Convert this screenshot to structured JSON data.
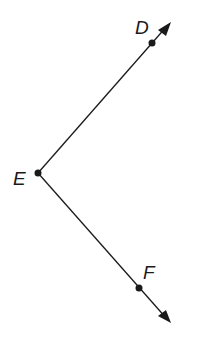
{
  "diagram": {
    "type": "angle",
    "vertex": {
      "label": "E",
      "x": 38,
      "y": 173
    },
    "rays": [
      {
        "from": "E",
        "through": "D",
        "point": {
          "label": "D",
          "x": 152,
          "y": 43
        },
        "tip": {
          "x": 171,
          "y": 22
        }
      },
      {
        "from": "E",
        "through": "F",
        "point": {
          "label": "F",
          "x": 139,
          "y": 288
        },
        "tip": {
          "x": 171,
          "y": 323
        }
      }
    ],
    "labels": {
      "D": "D",
      "E": "E",
      "F": "F"
    },
    "colors": {
      "line": "#1a1a1a",
      "background": "#ffffff"
    }
  }
}
